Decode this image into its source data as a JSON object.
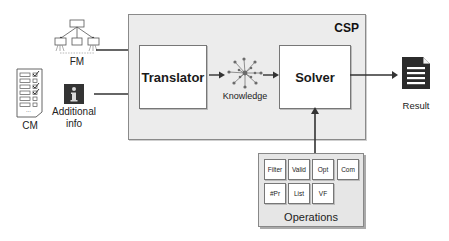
{
  "inputs": {
    "fm_label": "FM",
    "cm_label": "CM",
    "additional_info_label_line1": "Additional",
    "additional_info_label_line2": "info"
  },
  "csp": {
    "label": "CSP",
    "translator_label": "Translator",
    "knowledge_label": "Knowledge",
    "solver_label": "Solver"
  },
  "output": {
    "result_label": "Result"
  },
  "operations": {
    "label": "Operations",
    "items": [
      "Filter",
      "Valid",
      "Opt",
      "Com",
      "#Pr",
      "List",
      "VF"
    ]
  },
  "colors": {
    "csp_background": "#ececec",
    "ops_background": "#e6e6e6",
    "icon_dark": "#2b2b2b",
    "knowledge_nodes": "#6b6b6b"
  }
}
